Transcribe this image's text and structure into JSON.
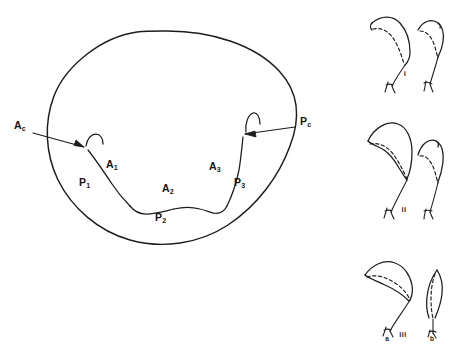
{
  "figure": {
    "type": "line-diagram",
    "background_color": "#ffffff",
    "ink_color": "#1c1c1c",
    "main_panel": {
      "name": "dorsal-outline-with-lobes",
      "shape": "closed oval outline with scalloped interior boundary",
      "labels": [
        {
          "id": "Ac",
          "base": "A",
          "sub": "c",
          "text": "Ac",
          "x": 14,
          "y": 129,
          "role": "callout-left"
        },
        {
          "id": "Pc",
          "base": "P",
          "sub": "c",
          "text": "Pc",
          "x": 300,
          "y": 125,
          "role": "callout-right"
        },
        {
          "id": "A1",
          "base": "A",
          "sub": "1",
          "text": "A1",
          "x": 106,
          "y": 168,
          "role": "region"
        },
        {
          "id": "A2",
          "base": "A",
          "sub": "2",
          "text": "A2",
          "x": 162,
          "y": 192,
          "role": "region"
        },
        {
          "id": "A3",
          "base": "A",
          "sub": "3",
          "text": "A3",
          "x": 209,
          "y": 170,
          "role": "region"
        },
        {
          "id": "P1",
          "base": "P",
          "sub": "1",
          "text": "P1",
          "x": 79,
          "y": 186,
          "role": "region"
        },
        {
          "id": "P2",
          "base": "P",
          "sub": "2",
          "text": "P2",
          "x": 155,
          "y": 221,
          "role": "region"
        },
        {
          "id": "P3",
          "base": "P",
          "sub": "3",
          "text": "P3",
          "x": 234,
          "y": 186,
          "role": "region"
        }
      ],
      "arrows": [
        {
          "name": "arrow-ac",
          "from_x": 33,
          "from_y": 133,
          "to_x": 86,
          "to_y": 146,
          "points_to": "anterior notch"
        },
        {
          "name": "arrow-pc",
          "from_x": 295,
          "from_y": 127,
          "to_x": 243,
          "to_y": 133,
          "points_to": "posterior notch"
        }
      ]
    },
    "side_panels": [
      {
        "id": "i",
        "numeral": "i",
        "numeral_x": 405,
        "numeral_y": 76,
        "elements": [
          {
            "name": "hook-left",
            "size": "medium",
            "dashed_inner": true
          },
          {
            "name": "hook-right",
            "size": "small",
            "dashed_inner": true
          }
        ],
        "sub_labels": []
      },
      {
        "id": "ii",
        "numeral": "ii",
        "numeral_x": 404,
        "numeral_y": 212,
        "elements": [
          {
            "name": "hook-left",
            "size": "large",
            "dashed_inner": true
          },
          {
            "name": "hook-right",
            "size": "small",
            "dashed_inner": true
          }
        ],
        "sub_labels": []
      },
      {
        "id": "iii",
        "numeral": "iii",
        "numeral_x": 403,
        "numeral_y": 337,
        "elements": [
          {
            "name": "hook-left",
            "size": "large",
            "dashed_inner": true
          },
          {
            "name": "hook-right",
            "size": "narrow",
            "dashed_inner": true
          }
        ],
        "sub_labels": [
          {
            "text": "a",
            "x": 387,
            "y": 341
          },
          {
            "text": "b",
            "x": 432,
            "y": 341
          }
        ]
      }
    ]
  }
}
